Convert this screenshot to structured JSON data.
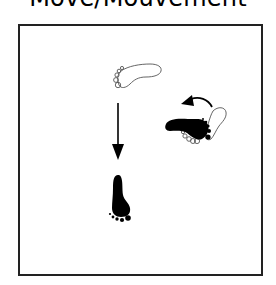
{
  "title": "Move/Mouvement",
  "diagram": {
    "elements": [
      {
        "id": "start-foot",
        "type": "footprint",
        "style": "outline",
        "orientation": "pointing-right"
      },
      {
        "id": "forward-arrow",
        "type": "arrow",
        "direction": "down"
      },
      {
        "id": "end-foot",
        "type": "footprint",
        "style": "filled",
        "orientation": "pointing-up"
      },
      {
        "id": "pivot-foot-start",
        "type": "footprint",
        "style": "outline",
        "orientation": "pointing-up-right"
      },
      {
        "id": "pivot-foot-end",
        "type": "footprint",
        "style": "filled",
        "orientation": "pointing-left"
      },
      {
        "id": "rotation-arrow",
        "type": "curved-arrow",
        "direction": "counter-clockwise"
      }
    ]
  },
  "colors": {
    "ink": "#000000",
    "frame": "#222222",
    "background": "#ffffff"
  }
}
